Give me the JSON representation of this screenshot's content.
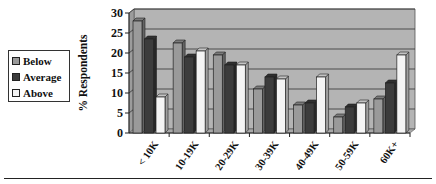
{
  "chart_data": {
    "type": "bar",
    "style": "3d-clustered-column",
    "title": "",
    "xlabel": "",
    "ylabel": "% Respondents",
    "ylim": [
      0,
      30
    ],
    "yticks": [
      0,
      5,
      10,
      15,
      20,
      25,
      30
    ],
    "grid": true,
    "legend_position": "left",
    "categories": [
      "< 10K",
      "10-19K",
      "20-29K",
      "30-39K",
      "40-49K",
      "50-59K",
      "60K+"
    ],
    "series": [
      {
        "name": "Below",
        "color": "#9a9a9a",
        "values": [
          28,
          22.5,
          19.5,
          11,
          7,
          4,
          8.5
        ]
      },
      {
        "name": "Average",
        "color": "#3c3c3c",
        "values": [
          23.5,
          19,
          17,
          14,
          7.5,
          6.5,
          12.5
        ]
      },
      {
        "name": "Above",
        "color": "#f4f4f4",
        "values": [
          9,
          20.5,
          17,
          13.5,
          14,
          7.5,
          19.5
        ]
      }
    ]
  },
  "legend": {
    "items": [
      {
        "label": "Below",
        "color": "#9a9a9a"
      },
      {
        "label": "Average",
        "color": "#3c3c3c"
      },
      {
        "label": "Above",
        "color": "#f4f4f4"
      }
    ]
  },
  "colors": {
    "plot_background": "#b4b4b4",
    "gridline": "#333333"
  }
}
